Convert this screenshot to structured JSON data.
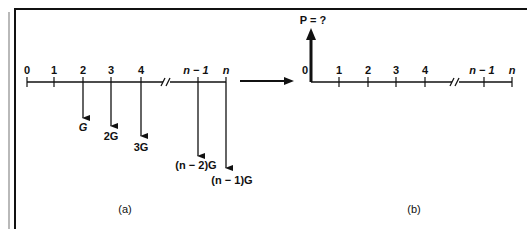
{
  "figure": {
    "panel_a": {
      "caption": "(a)",
      "period_labels": [
        "0",
        "1",
        "2",
        "3",
        "4",
        "n − 1",
        "n"
      ],
      "cash_flows": [
        {
          "period": "2",
          "label": "G"
        },
        {
          "period": "3",
          "label": "2G"
        },
        {
          "period": "4",
          "label": "3G"
        },
        {
          "period": "n − 1",
          "label": "(n − 2)G"
        },
        {
          "period": "n",
          "label": "(n − 1)G"
        }
      ],
      "direction": "down"
    },
    "transform_arrow": "equivalent-to",
    "panel_b": {
      "caption": "(b)",
      "present_value_label": "P = ?",
      "period_labels": [
        "0",
        "1",
        "2",
        "3",
        "4",
        "n − 1",
        "n"
      ],
      "direction": "up"
    }
  },
  "colors": {
    "ink": "#111111",
    "border_gray": "#8a8a8a",
    "background": "#ffffff"
  }
}
